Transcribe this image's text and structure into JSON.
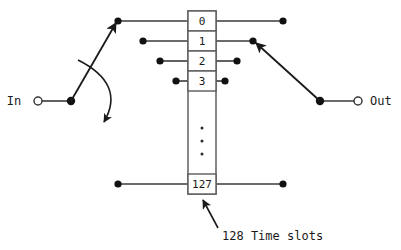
{
  "diagram": {
    "type": "time-division-multiplexer-switch",
    "ports": {
      "input": {
        "label": "In",
        "terminal_x": 38,
        "terminal_y": 101,
        "pivot_x": 71,
        "pivot_y": 101
      },
      "output": {
        "label": "Out",
        "terminal_x": 358,
        "terminal_y": 101,
        "pivot_x": 320,
        "pivot_y": 101
      }
    },
    "slot_column": {
      "x": 188,
      "width": 28,
      "top": 11,
      "slot_height": 20,
      "bottom": 194
    },
    "slots": [
      {
        "label": "0",
        "y_center": 21,
        "left_dot_x": 118,
        "right_dot_x": 283
      },
      {
        "label": "1",
        "y_center": 41,
        "left_dot_x": 143,
        "right_dot_x": 253
      },
      {
        "label": "2",
        "y_center": 61,
        "left_dot_x": 160,
        "right_dot_x": 237
      },
      {
        "label": "3",
        "y_center": 81,
        "left_dot_x": 176,
        "right_dot_x": 225
      },
      {
        "label": "127",
        "y_center": 184,
        "left_dot_x": 118,
        "right_dot_x": 283
      }
    ],
    "ellipsis": {
      "x": 202,
      "dots_y": [
        128,
        141,
        154
      ]
    },
    "annotation": {
      "text": "128 Time slots",
      "text_x": 222,
      "text_y": 236,
      "arrow_from_x": 218,
      "arrow_from_y": 228,
      "arrow_to_x": 202,
      "arrow_to_y": 199
    },
    "sweep_arc": {
      "start_x": 78,
      "start_y": 60,
      "ctrl_x": 126,
      "ctrl_y": 84,
      "end_x": 104,
      "end_y": 122
    },
    "colors": {
      "wire": "#3a3a3a",
      "ink": "#1a1a1a",
      "dot": "#111111",
      "box_stroke": "#5a5a5a",
      "background": "#ffffff"
    }
  }
}
